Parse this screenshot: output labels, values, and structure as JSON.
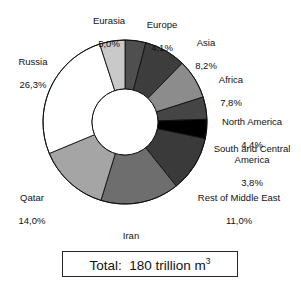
{
  "chart_data": {
    "type": "pie",
    "title": "",
    "subtitle": "",
    "xlabel": "",
    "ylabel": "",
    "donut": true,
    "legend_position": "outside-labels",
    "grid": false,
    "start_angle_deg": 0,
    "direction": "clockwise",
    "value_unit": "%",
    "decimal_separator": ",",
    "categories": [
      "Europe",
      "Asia",
      "Africa",
      "North America",
      "South and Central America",
      "Rest of Middle East",
      "Iran",
      "Qatar",
      "Russia",
      "Eurasia"
    ],
    "values": [
      4.1,
      8.2,
      7.8,
      4.4,
      3.8,
      11.0,
      15.5,
      14.0,
      26.3,
      5.0
    ],
    "value_labels": [
      "4,1%",
      "8,2%",
      "7,8%",
      "4,4%",
      "3,8%",
      "11,0%",
      "15,5%",
      "14,0%",
      "26,3%",
      "5,0%"
    ],
    "colors": [
      "#4f4f4f",
      "#3d3d3d",
      "#8c8c8c",
      "#454545",
      "#000000",
      "#3a3a3a",
      "#6e6e6e",
      "#a5a5a5",
      "#ffffff",
      "#c9c9c9"
    ],
    "annotation": "Total:  180 trillion m3",
    "total_value": 180,
    "total_unit": "trillion m3"
  },
  "labels": {
    "eurasia": {
      "name": "Eurasia",
      "pct": "5,0%"
    },
    "europe": {
      "name": "Europe",
      "pct": "4,1%"
    },
    "asia": {
      "name": "Asia",
      "pct": "8,2%"
    },
    "africa": {
      "name": "Africa",
      "pct": "7,8%"
    },
    "north_america": {
      "name": "North America",
      "pct": "4,4%"
    },
    "south_central_america": {
      "name": "South and Central America",
      "pct": "3,8%"
    },
    "rest_middle_east": {
      "name": "Rest of Middle East",
      "pct": "11,0%"
    },
    "iran": {
      "name": "Iran",
      "pct": "15,5%"
    },
    "qatar": {
      "name": "Qatar",
      "pct": "14,0%"
    },
    "russia": {
      "name": "Russia",
      "pct": "26,3%"
    }
  },
  "total": {
    "prefix": "Total:",
    "amount": "180",
    "unit": "trillion m",
    "exponent": "3"
  }
}
